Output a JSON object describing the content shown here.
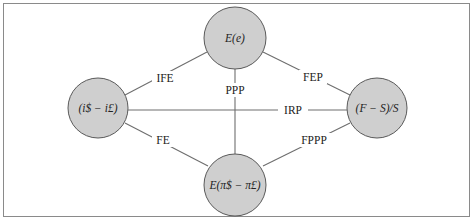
{
  "diagram": {
    "nodes": [
      {
        "id": "interest-differential",
        "label": "(i$ − i£)",
        "cx": 98,
        "cy": 108,
        "r": 30
      },
      {
        "id": "expected-exchange-change",
        "label": "E(e)",
        "cx": 235,
        "cy": 38,
        "r": 31
      },
      {
        "id": "forward-premium",
        "label": "(F − S)/S",
        "cx": 377,
        "cy": 108,
        "r": 30
      },
      {
        "id": "expected-inflation-differential",
        "label": "E(π$ − π£)",
        "cx": 235,
        "cy": 185,
        "r": 31
      }
    ],
    "edges": [
      {
        "label": "IFE",
        "from": "interest-differential",
        "to": "expected-exchange-change"
      },
      {
        "label": "FEP",
        "from": "expected-exchange-change",
        "to": "forward-premium"
      },
      {
        "label": "PPP",
        "from": "expected-exchange-change",
        "to": "expected-inflation-differential"
      },
      {
        "label": "IRP",
        "from": "interest-differential",
        "to": "forward-premium"
      },
      {
        "label": "FE",
        "from": "interest-differential",
        "to": "expected-inflation-differential"
      },
      {
        "label": "FPPP",
        "from": "forward-premium",
        "to": "expected-inflation-differential"
      }
    ],
    "colors": {
      "node_fill": "#cfcfcf",
      "node_stroke": "#5a5a5a",
      "edge": "#6e6e6e",
      "frame": "#8a8a8a"
    }
  }
}
